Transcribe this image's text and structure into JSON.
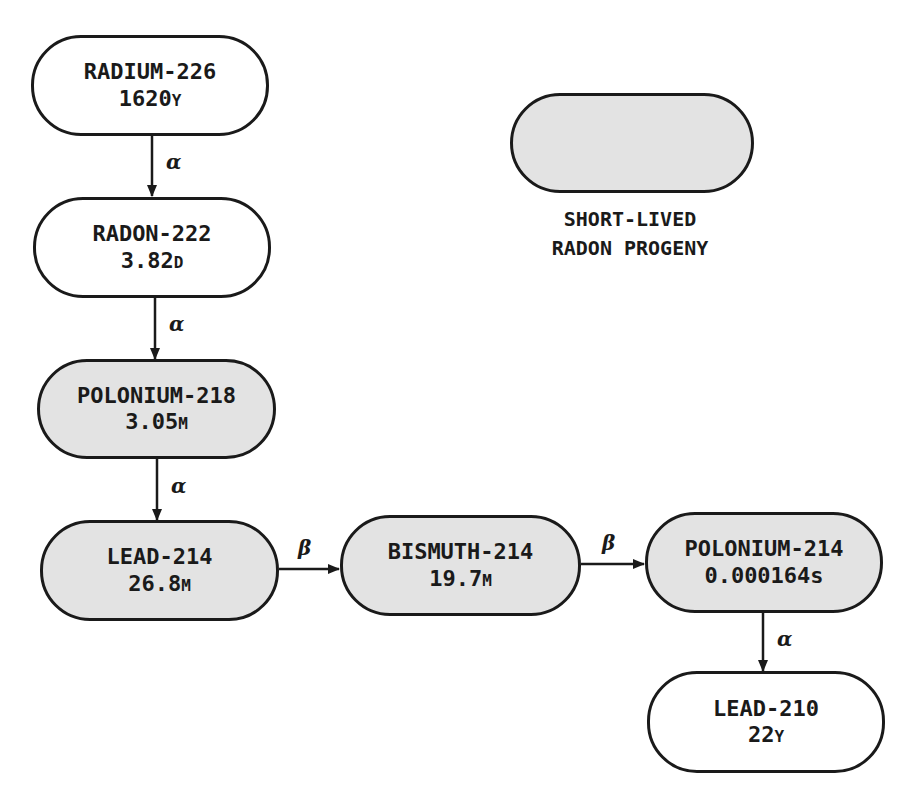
{
  "diagram": {
    "type": "decay-chain",
    "legend": {
      "swatch_color": "#e3e3e3",
      "caption_line1": "SHORT-LIVED",
      "caption_line2": "RADON PROGENY"
    },
    "nodes": [
      {
        "id": "radium-226",
        "name": "RADIUM-226",
        "half_life_value": "1620",
        "half_life_unit": "Y",
        "short_lived": false
      },
      {
        "id": "radon-222",
        "name": "RADON-222",
        "half_life_value": "3.82",
        "half_life_unit": "D",
        "short_lived": false
      },
      {
        "id": "polonium-218",
        "name": "POLONIUM-218",
        "half_life_value": "3.05",
        "half_life_unit": "M",
        "short_lived": true
      },
      {
        "id": "lead-214",
        "name": "LEAD-214",
        "half_life_value": "26.8",
        "half_life_unit": "M",
        "short_lived": true
      },
      {
        "id": "bismuth-214",
        "name": "BISMUTH-214",
        "half_life_value": "19.7",
        "half_life_unit": "M",
        "short_lived": true
      },
      {
        "id": "polonium-214",
        "name": "POLONIUM-214",
        "half_life_value": "0.000164",
        "half_life_unit": "s",
        "short_lived": true
      },
      {
        "id": "lead-210",
        "name": "LEAD-210",
        "half_life_value": "22",
        "half_life_unit": "Y",
        "short_lived": false
      }
    ],
    "edges": [
      {
        "from": "radium-226",
        "to": "radon-222",
        "decay": "α"
      },
      {
        "from": "radon-222",
        "to": "polonium-218",
        "decay": "α"
      },
      {
        "from": "polonium-218",
        "to": "lead-214",
        "decay": "α"
      },
      {
        "from": "lead-214",
        "to": "bismuth-214",
        "decay": "β"
      },
      {
        "from": "bismuth-214",
        "to": "polonium-214",
        "decay": "β"
      },
      {
        "from": "polonium-214",
        "to": "lead-210",
        "decay": "α"
      }
    ]
  }
}
